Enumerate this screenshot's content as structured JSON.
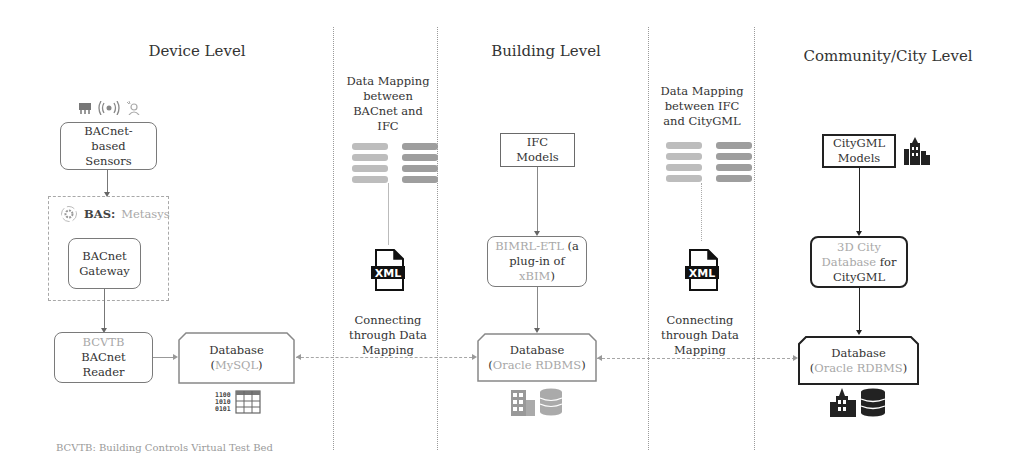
{
  "levels": {
    "device": "Device Level",
    "building": "Building Level",
    "city": "Community/City Level"
  },
  "device": {
    "sensors_icons": [
      "chip-icon",
      "wireless-signal-icon",
      "occupancy-sensor-icon"
    ],
    "sensors_box": [
      "BACnet-",
      "based",
      "Sensors"
    ],
    "bas_label_bold": "BAS:",
    "bas_label_muted": "Metasys",
    "gateway_box": [
      "BACnet",
      "Gateway"
    ],
    "reader_box": {
      "muted": "BCVTB",
      "lines": [
        "BACnet",
        "Reader"
      ]
    },
    "database_box": {
      "title": "Database",
      "paren_open": "(",
      "muted": "MySQL",
      "paren_close": ")"
    },
    "binary_icon_text": [
      "1100",
      "1010",
      "0101"
    ],
    "footnote": "BCVTB: Building Controls Virtual Test Bed"
  },
  "mapping1": {
    "title": [
      "Data Mapping",
      "between",
      "BACnet and",
      "IFC"
    ],
    "xml_label": "XML",
    "connect": [
      "Connecting",
      "through Data",
      "Mapping"
    ]
  },
  "building": {
    "ifc_box": [
      "IFC",
      "Models"
    ],
    "bimrl_box": {
      "muted1": "BIMRL-ETL",
      "dark1": " (a",
      "dark2": "plug-in of",
      "muted2": "xBIM",
      "dark3": ")"
    },
    "database_box": {
      "title": "Database",
      "paren_open": "(",
      "muted": "Oracle RDBMS",
      "paren_close": ")"
    }
  },
  "mapping2": {
    "title": [
      "Data Mapping",
      "between IFC",
      "and CityGML"
    ],
    "xml_label": "XML",
    "connect": [
      "Connecting",
      "through Data",
      "Mapping"
    ]
  },
  "city": {
    "citygml_box": [
      "CityGML",
      "Models"
    ],
    "db3d_box": {
      "muted1": "3D City",
      "muted2": "Database",
      "dark1": " for",
      "dark2": "CityGML"
    },
    "database_box": {
      "title": "Database",
      "paren_open": "(",
      "muted": "Oracle RDBMS",
      "paren_close": ")"
    }
  }
}
